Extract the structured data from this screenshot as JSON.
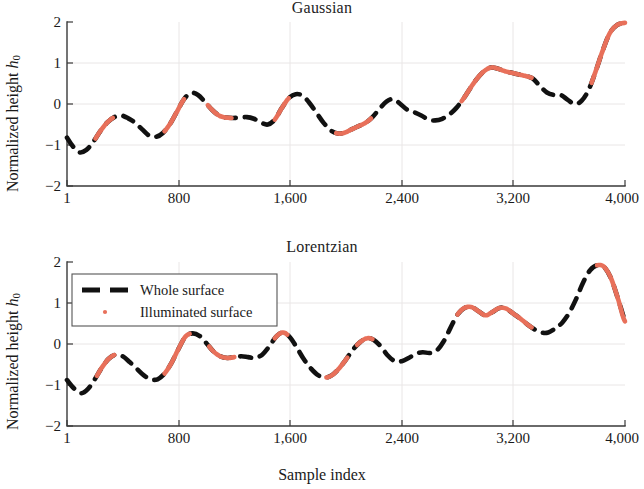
{
  "figure": {
    "xlabel": "Sample index",
    "ylabel_prefix": "Normalized height ",
    "ylabel_symbol": "h",
    "ylabel_subscript": "0"
  },
  "legend": {
    "whole_label": "Whole surface",
    "illuminated_label": "Illuminated surface",
    "whole_color": "#111111",
    "illuminated_color": "#E8705A"
  },
  "panels": {
    "gaussian": {
      "title": "Gaussian"
    },
    "lorentzian": {
      "title": "Lorentzian"
    }
  },
  "axes": {
    "x_ticks": [
      "1",
      "800",
      "1,600",
      "2,400",
      "3,200",
      "4,000"
    ],
    "x_tick_values": [
      1,
      800,
      1600,
      2400,
      3200,
      4000
    ],
    "y_ticks": [
      "2",
      "1",
      "0",
      "−1",
      "−2"
    ],
    "y_tick_values": [
      2,
      1,
      0,
      -1,
      -2
    ],
    "xlim": [
      1,
      4000
    ],
    "ylim": [
      -2,
      2
    ]
  },
  "chart_data": {
    "type": "line",
    "xlabel": "Sample index",
    "ylabel": "Normalized height h0",
    "xlim": [
      1,
      4000
    ],
    "ylim": [
      -2,
      2
    ],
    "grid": true,
    "legend_position": "upper-left (Lorentzian panel)",
    "x_tick_labels": [
      "1",
      "800",
      "1,600",
      "2,400",
      "3,200",
      "4,000"
    ],
    "y_tick_labels": [
      "2",
      "1",
      "0",
      "-1",
      "-2"
    ],
    "panels": [
      {
        "name": "Gaussian",
        "series": [
          {
            "name": "Whole surface",
            "style": "dashed",
            "color": "#111111",
            "x": [
              1,
              40,
              90,
              140,
              190,
              240,
              290,
              340,
              390,
              440,
              490,
              540,
              590,
              640,
              690,
              740,
              790,
              840,
              890,
              940,
              990,
              1040,
              1090,
              1140,
              1190,
              1240,
              1290,
              1340,
              1390,
              1440,
              1490,
              1540,
              1590,
              1640,
              1690,
              1740,
              1790,
              1840,
              1890,
              1940,
              1990,
              2040,
              2090,
              2140,
              2190,
              2240,
              2290,
              2340,
              2390,
              2440,
              2490,
              2540,
              2590,
              2640,
              2690,
              2740,
              2790,
              2840,
              2890,
              2940,
              2990,
              3040,
              3090,
              3140,
              3190,
              3240,
              3290,
              3340,
              3390,
              3440,
              3490,
              3540,
              3590,
              3640,
              3690,
              3740,
              3790,
              3840,
              3890,
              3940,
              4000
            ],
            "y": [
              -0.82,
              -1.02,
              -1.18,
              -1.12,
              -0.92,
              -0.66,
              -0.45,
              -0.32,
              -0.28,
              -0.35,
              -0.46,
              -0.62,
              -0.77,
              -0.8,
              -0.7,
              -0.48,
              -0.18,
              0.12,
              0.27,
              0.22,
              0.05,
              -0.14,
              -0.28,
              -0.33,
              -0.34,
              -0.33,
              -0.32,
              -0.36,
              -0.45,
              -0.5,
              -0.38,
              -0.1,
              0.14,
              0.24,
              0.2,
              0.02,
              -0.22,
              -0.46,
              -0.64,
              -0.72,
              -0.7,
              -0.62,
              -0.54,
              -0.46,
              -0.32,
              -0.12,
              0.06,
              0.12,
              0.0,
              -0.14,
              -0.2,
              -0.28,
              -0.38,
              -0.4,
              -0.36,
              -0.26,
              -0.1,
              0.12,
              0.38,
              0.62,
              0.8,
              0.89,
              0.86,
              0.8,
              0.76,
              0.72,
              0.68,
              0.62,
              0.44,
              0.28,
              0.22,
              0.22,
              0.1,
              0.0,
              0.08,
              0.35,
              0.8,
              1.3,
              1.72,
              1.92,
              1.98
            ]
          },
          {
            "name": "Illuminated surface",
            "style": "solid",
            "color": "#E8705A",
            "segments": [
              {
                "x_range": [
                  205,
                  330
                ],
                "description": "small crest near -0.28"
              },
              {
                "x_range": [
                  700,
                  840
                ],
                "description": "rise to 0.27 then fall to -0.30"
              },
              {
                "x_range": [
                  1010,
                  1180
                ],
                "description": "crest 0.24 descending to -0.55"
              },
              {
                "x_range": [
                  1490,
                  1590
                ],
                "description": "small crest 0.14"
              },
              {
                "x_range": [
                  1930,
                  2180
                ],
                "description": "plateau near 0.9 down to 0.68"
              },
              {
                "x_range": [
                  2830,
                  3330
                ],
                "description": "peak 2.0 falling to 0.15 plateau then -0.45"
              },
              {
                "x_range": [
                  3760,
                  4000
                ],
                "description": "crest 0.62 falling to 0.0"
              }
            ]
          }
        ]
      },
      {
        "name": "Lorentzian",
        "series": [
          {
            "name": "Whole surface",
            "style": "dashed",
            "color": "#111111",
            "x": [
              1,
              50,
              100,
              150,
              200,
              250,
              300,
              350,
              400,
              450,
              500,
              550,
              600,
              650,
              700,
              750,
              800,
              850,
              900,
              950,
              1000,
              1050,
              1100,
              1150,
              1200,
              1250,
              1300,
              1350,
              1400,
              1450,
              1500,
              1550,
              1600,
              1650,
              1700,
              1750,
              1800,
              1850,
              1900,
              1950,
              2000,
              2050,
              2100,
              2150,
              2200,
              2250,
              2300,
              2350,
              2400,
              2450,
              2500,
              2550,
              2600,
              2650,
              2700,
              2750,
              2800,
              2850,
              2900,
              2950,
              3000,
              3050,
              3100,
              3150,
              3200,
              3250,
              3300,
              3350,
              3400,
              3450,
              3500,
              3550,
              3600,
              3650,
              3700,
              3750,
              3800,
              3850,
              3900,
              3950,
              4000
            ],
            "y": [
              -0.88,
              -1.08,
              -1.2,
              -1.1,
              -0.86,
              -0.58,
              -0.36,
              -0.26,
              -0.3,
              -0.44,
              -0.6,
              -0.76,
              -0.86,
              -0.86,
              -0.72,
              -0.46,
              -0.12,
              0.18,
              0.26,
              0.2,
              0.02,
              -0.18,
              -0.3,
              -0.34,
              -0.32,
              -0.3,
              -0.32,
              -0.34,
              -0.26,
              -0.06,
              0.18,
              0.28,
              0.16,
              -0.1,
              -0.38,
              -0.6,
              -0.76,
              -0.82,
              -0.76,
              -0.6,
              -0.38,
              -0.14,
              0.04,
              0.14,
              0.1,
              -0.06,
              -0.28,
              -0.42,
              -0.42,
              -0.34,
              -0.24,
              -0.2,
              -0.22,
              -0.16,
              0.06,
              0.4,
              0.72,
              0.88,
              0.9,
              0.8,
              0.7,
              0.78,
              0.88,
              0.86,
              0.74,
              0.62,
              0.48,
              0.36,
              0.28,
              0.28,
              0.38,
              0.52,
              0.76,
              1.1,
              1.5,
              1.8,
              1.92,
              1.88,
              1.6,
              1.1,
              0.55
            ]
          },
          {
            "name": "Illuminated surface",
            "style": "solid",
            "color": "#E8705A",
            "segments": [
              {
                "x_range": [
                  215,
                  340
                ],
                "description": "small crest near -0.27"
              },
              {
                "x_range": [
                  700,
                  880
                ],
                "description": "rise to 0.26 then fall to -0.33"
              },
              {
                "x_range": [
                  1020,
                  1200
                ],
                "description": "crest 0.27 descending to -0.60"
              },
              {
                "x_range": [
                  1490,
                  1580
                ],
                "description": "small crest 0.15"
              },
              {
                "x_range": [
                  1860,
                  2010
                ],
                "description": "plateau near 0.88"
              },
              {
                "x_range": [
                  2080,
                  2190
                ],
                "description": "crest 0.88"
              },
              {
                "x_range": [
                  2800,
                  3330
                ],
                "description": "peak 1.95 falling to 0.12 plateau then -0.42"
              },
              {
                "x_range": [
                  3800,
                  4000
                ],
                "description": "crest 0.30 falling to -0.28"
              }
            ]
          }
        ]
      }
    ]
  }
}
